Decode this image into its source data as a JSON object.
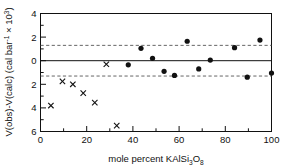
{
  "chart_data": {
    "type": "scatter",
    "title": "",
    "xlabel_parts": {
      "main": "mole percent  KAlSi",
      "sub1": "3",
      "mid": "O",
      "sub2": "8"
    },
    "xlabel": "mole percent KAlSi3O8",
    "ylabel": "V(obs)-V(calc) (cal bar-1 x 103)",
    "ylabel_parts": {
      "a": "V(obs)-V(calc) (cal bar",
      "sup1": "-1",
      "b": " × 10",
      "sup2": "3",
      "c": ")"
    },
    "xlim": [
      0,
      100
    ],
    "ylim": [
      -6,
      4
    ],
    "xticks": [
      0,
      20,
      40,
      60,
      80,
      100
    ],
    "xticklabels": [
      "0",
      "20",
      "40",
      "60",
      "80",
      "100"
    ],
    "xminorticks": [
      10,
      30,
      50,
      70,
      90
    ],
    "yticks": [
      4,
      2,
      0,
      -2,
      -4,
      -6
    ],
    "yticklabels": [
      "4",
      "2",
      "0",
      "2",
      "4",
      "6"
    ],
    "yminorticks": [
      3,
      1,
      -1,
      -3,
      -5
    ],
    "grid": false,
    "zero_line": 0,
    "reference_lines": [
      1.3,
      -1.3
    ],
    "reference_line_style": "dashed",
    "series": [
      {
        "name": "cross-markers",
        "marker": "x",
        "color": "#111111",
        "points": [
          {
            "x": 4.5,
            "y": -3.8
          },
          {
            "x": 9.5,
            "y": -1.75
          },
          {
            "x": 14.0,
            "y": -2.0
          },
          {
            "x": 18.5,
            "y": -2.75
          },
          {
            "x": 23.5,
            "y": -3.55
          },
          {
            "x": 28.5,
            "y": -0.3
          },
          {
            "x": 33.0,
            "y": -5.5
          }
        ]
      },
      {
        "name": "circle-markers",
        "marker": "o",
        "color": "#111111",
        "points": [
          {
            "x": 38.0,
            "y": -0.35
          },
          {
            "x": 43.5,
            "y": 1.05
          },
          {
            "x": 48.5,
            "y": 0.2
          },
          {
            "x": 53.5,
            "y": -0.9
          },
          {
            "x": 58.0,
            "y": -1.25
          },
          {
            "x": 63.5,
            "y": 1.65
          },
          {
            "x": 68.5,
            "y": -0.7
          },
          {
            "x": 73.5,
            "y": 0.05
          },
          {
            "x": 84.0,
            "y": 1.1
          },
          {
            "x": 89.5,
            "y": -1.4
          },
          {
            "x": 95.0,
            "y": 1.75
          },
          {
            "x": 100.0,
            "y": -1.05
          }
        ]
      }
    ]
  },
  "colors": {
    "axis": "#111111",
    "marker": "#111111",
    "reference": "#555555",
    "background": "#ffffff"
  }
}
